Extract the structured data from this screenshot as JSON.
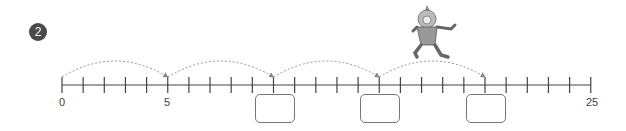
{
  "problem": {
    "number": "2"
  },
  "number_line": {
    "start": 0,
    "end": 25,
    "tick_step": 1,
    "labels": [
      {
        "value": 0,
        "text": "0"
      },
      {
        "value": 5,
        "text": "5"
      },
      {
        "value": 25,
        "text": "25"
      }
    ],
    "jumps": [
      {
        "from": 0,
        "to": 5
      },
      {
        "from": 5,
        "to": 10
      },
      {
        "from": 10,
        "to": 15
      },
      {
        "from": 15,
        "to": 20
      }
    ],
    "answer_boxes": [
      {
        "at": 10,
        "value": ""
      },
      {
        "at": 15,
        "value": ""
      },
      {
        "at": 20,
        "value": ""
      }
    ]
  },
  "illustration": {
    "icon": "jumping-clown-icon"
  }
}
